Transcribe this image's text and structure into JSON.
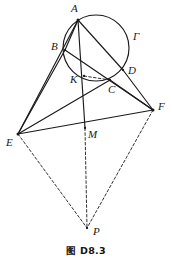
{
  "figure": {
    "caption": "图 D8.3",
    "stroke_color": "#1a1a1a",
    "background_color": "#ffffff"
  },
  "points": {
    "A": {
      "label": "A",
      "x": 78,
      "y": 20,
      "label_x": 71,
      "label_y": 3
    },
    "B": {
      "label": "B",
      "x": 65,
      "y": 50,
      "label_x": 51,
      "label_y": 41
    },
    "C": {
      "label": "C",
      "x": 110,
      "y": 80,
      "label_x": 108,
      "label_y": 84
    },
    "D": {
      "label": "D",
      "x": 123,
      "y": 70,
      "label_x": 128,
      "label_y": 65
    },
    "E": {
      "label": "E",
      "x": 18,
      "y": 134,
      "label_x": 6,
      "label_y": 137
    },
    "F": {
      "label": "F",
      "x": 153,
      "y": 110,
      "label_x": 158,
      "label_y": 101
    },
    "K": {
      "label": "K",
      "x": 84,
      "y": 76,
      "label_x": 70,
      "label_y": 74
    },
    "M": {
      "label": "M",
      "x": 85,
      "y": 128,
      "label_x": 88,
      "label_y": 129
    },
    "P": {
      "label": "P",
      "x": 87,
      "y": 228,
      "label_x": 93,
      "label_y": 226
    },
    "Gamma": {
      "label": "Γ",
      "x": 125,
      "y": 32,
      "label_x": 133,
      "label_y": 31
    }
  },
  "circle": {
    "name": "circumcircle-gamma",
    "cx": 96,
    "cy": 48,
    "r": 33
  },
  "solid_segments": [
    {
      "name": "segment-A-B",
      "from": "A",
      "to": "B"
    },
    {
      "name": "segment-A-M",
      "from": "A",
      "to": "M"
    },
    {
      "name": "segment-A-D",
      "from": "A",
      "to": "D"
    },
    {
      "name": "segment-A-E",
      "from": "A",
      "to": "E"
    },
    {
      "name": "segment-B-E",
      "from": "B",
      "to": "E"
    },
    {
      "name": "segment-B-F",
      "from": "B",
      "to": "F"
    },
    {
      "name": "segment-D-F",
      "from": "D",
      "to": "F"
    },
    {
      "name": "segment-C-F",
      "from": "C",
      "to": "F"
    },
    {
      "name": "segment-E-C",
      "from": "E",
      "to": "C"
    },
    {
      "name": "segment-E-F",
      "from": "E",
      "to": "F"
    }
  ],
  "dashed_segments": [
    {
      "name": "segment-K-C-dashed",
      "from": "K",
      "to": "C"
    },
    {
      "name": "segment-M-P-dashed",
      "from": "M",
      "to": "P"
    },
    {
      "name": "segment-E-P-dashed",
      "from": "E",
      "to": "P"
    },
    {
      "name": "segment-F-P-dashed",
      "from": "F",
      "to": "P"
    }
  ],
  "label_order": [
    "A",
    "B",
    "Gamma",
    "D",
    "K",
    "C",
    "F",
    "E",
    "M",
    "P"
  ]
}
